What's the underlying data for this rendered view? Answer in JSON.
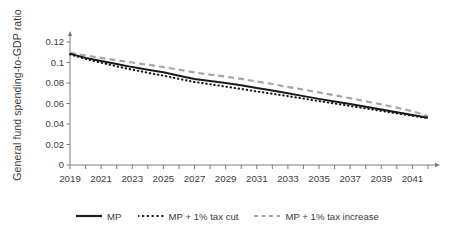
{
  "chart_data": {
    "type": "line",
    "title": "",
    "xlabel": "",
    "ylabel": "General fund spending-to-GDP ratio",
    "xlim": [
      2019,
      2042
    ],
    "ylim": [
      0,
      0.12
    ],
    "grid": false,
    "legend_position": "bottom",
    "x": [
      2019,
      2020,
      2021,
      2022,
      2023,
      2024,
      2025,
      2026,
      2027,
      2028,
      2029,
      2030,
      2031,
      2032,
      2033,
      2034,
      2035,
      2036,
      2037,
      2038,
      2039,
      2040,
      2041,
      2042
    ],
    "ytick_labels": [
      "0",
      "0.02",
      "0.04",
      "0.06",
      "0.08",
      "0.1",
      "0.12"
    ],
    "ytick_values": [
      0,
      0.02,
      0.04,
      0.06,
      0.08,
      0.1,
      0.12
    ],
    "xtick_labels": [
      "2019",
      "2021",
      "2023",
      "2025",
      "2027",
      "2029",
      "2031",
      "2033",
      "2035",
      "2037",
      "2039",
      "2041"
    ],
    "xtick_values": [
      2019,
      2021,
      2023,
      2025,
      2027,
      2029,
      2031,
      2033,
      2035,
      2037,
      2039,
      2041
    ],
    "series": [
      {
        "name": "MP",
        "style": "solid",
        "color": "#1a1a1a",
        "values": [
          0.1085,
          0.1045,
          0.1015,
          0.0985,
          0.0955,
          0.093,
          0.0905,
          0.087,
          0.0838,
          0.082,
          0.08,
          0.0778,
          0.0752,
          0.0726,
          0.07,
          0.0672,
          0.0645,
          0.062,
          0.0594,
          0.0568,
          0.0542,
          0.0515,
          0.0487,
          0.0462
        ]
      },
      {
        "name": "MP + 1% tax cut",
        "style": "dotted",
        "color": "#1a1a1a",
        "values": [
          0.108,
          0.1035,
          0.0998,
          0.0962,
          0.093,
          0.09,
          0.0872,
          0.084,
          0.081,
          0.0788,
          0.0765,
          0.0742,
          0.0718,
          0.0695,
          0.0672,
          0.0648,
          0.0624,
          0.06,
          0.0576,
          0.0552,
          0.0528,
          0.0504,
          0.048,
          0.0458
        ]
      },
      {
        "name": "MP + 1% tax increase",
        "style": "dashed",
        "color": "#a6a6a6",
        "values": [
          0.1095,
          0.1068,
          0.1045,
          0.1022,
          0.1,
          0.0978,
          0.0955,
          0.093,
          0.0903,
          0.0882,
          0.0862,
          0.084,
          0.0815,
          0.079,
          0.0762,
          0.0735,
          0.0708,
          0.068,
          0.0652,
          0.0622,
          0.0592,
          0.056,
          0.0525,
          0.0478
        ]
      }
    ]
  },
  "legend": {
    "items": [
      {
        "label": "MP"
      },
      {
        "label": "MP + 1% tax cut"
      },
      {
        "label": "MP + 1% tax increase"
      }
    ]
  },
  "colors": {
    "axis": "#7a7a7a",
    "text": "#3d3d3d",
    "solid_line": "#1a1a1a",
    "dotted_line": "#1a1a1a",
    "dashed_line": "#a6a6a6",
    "background": "#ffffff"
  }
}
